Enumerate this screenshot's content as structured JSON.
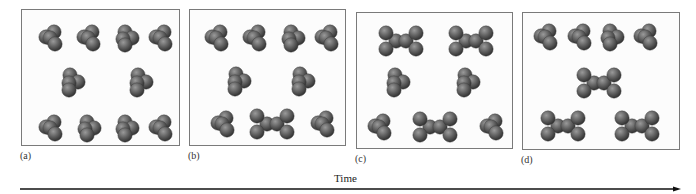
{
  "figure": {
    "panels": [
      {
        "id": "a",
        "label": "(a)",
        "box": {
          "x": 21,
          "y": 9,
          "w": 159,
          "h": 137
        },
        "monomers": [
          {
            "x": 28,
            "y": 28,
            "o": 0
          },
          {
            "x": 66,
            "y": 28,
            "o": 0
          },
          {
            "x": 104,
            "y": 28,
            "o": 1
          },
          {
            "x": 138,
            "y": 28,
            "o": 0
          },
          {
            "x": 50,
            "y": 73,
            "o": 2
          },
          {
            "x": 118,
            "y": 73,
            "o": 2
          },
          {
            "x": 28,
            "y": 118,
            "o": 0
          },
          {
            "x": 66,
            "y": 118,
            "o": 1
          },
          {
            "x": 104,
            "y": 118,
            "o": 1
          },
          {
            "x": 138,
            "y": 118,
            "o": 0
          }
        ],
        "dimers": []
      },
      {
        "id": "b",
        "label": "(b)",
        "box": {
          "x": 189,
          "y": 9,
          "w": 157,
          "h": 137
        },
        "monomers": [
          {
            "x": 26,
            "y": 28,
            "o": 0
          },
          {
            "x": 64,
            "y": 28,
            "o": 0
          },
          {
            "x": 102,
            "y": 28,
            "o": 1
          },
          {
            "x": 136,
            "y": 28,
            "o": 0
          },
          {
            "x": 48,
            "y": 72,
            "o": 2
          },
          {
            "x": 112,
            "y": 72,
            "o": 2
          },
          {
            "x": 32,
            "y": 114,
            "o": 0
          },
          {
            "x": 132,
            "y": 114,
            "o": 0
          }
        ],
        "dimers": [
          {
            "x": 82,
            "y": 114
          }
        ]
      },
      {
        "id": "c",
        "label": "(c)",
        "box": {
          "x": 356,
          "y": 12,
          "w": 157,
          "h": 137
        },
        "monomers": [
          {
            "x": 40,
            "y": 70,
            "o": 2
          },
          {
            "x": 110,
            "y": 70,
            "o": 2
          },
          {
            "x": 22,
            "y": 114,
            "o": 0
          },
          {
            "x": 134,
            "y": 114,
            "o": 0
          }
        ],
        "dimers": [
          {
            "x": 44,
            "y": 28
          },
          {
            "x": 114,
            "y": 28
          },
          {
            "x": 78,
            "y": 114
          }
        ]
      },
      {
        "id": "d",
        "label": "(d)",
        "box": {
          "x": 522,
          "y": 12,
          "w": 158,
          "h": 138
        },
        "monomers": [
          {
            "x": 22,
            "y": 24,
            "o": 0
          },
          {
            "x": 56,
            "y": 24,
            "o": 0
          },
          {
            "x": 88,
            "y": 24,
            "o": 1
          },
          {
            "x": 122,
            "y": 24,
            "o": 0
          }
        ],
        "dimers": [
          {
            "x": 76,
            "y": 70
          },
          {
            "x": 40,
            "y": 113
          },
          {
            "x": 114,
            "y": 113
          }
        ]
      }
    ],
    "time_axis": {
      "label": "Time",
      "label_x": 334,
      "label_y": 172,
      "x_start": 20,
      "x_end": 681,
      "y": 189
    },
    "colors": {
      "sphere_light": "#9a9a9a",
      "sphere_mid": "#5e5e5e",
      "sphere_dark": "#2f2f2f",
      "border": "#7a7a7a",
      "arrow": "#111111"
    }
  }
}
